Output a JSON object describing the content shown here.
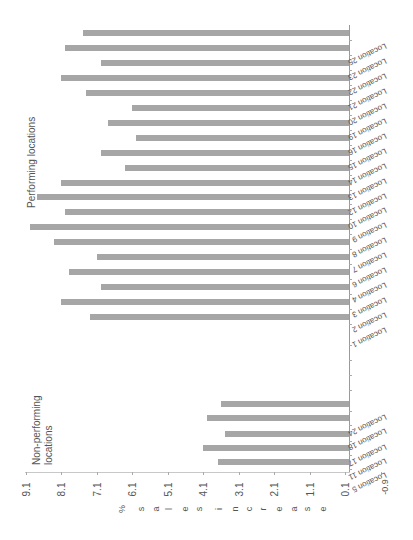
{
  "chart_data": {
    "type": "bar",
    "orientation": "rotated-90 (bars extend right-to-left; value axis along bottom)",
    "title": "",
    "ylabel": "% sales increase",
    "xlabel": "",
    "ylim": [
      -0.9,
      9.1
    ],
    "value_ticks": [
      "9.1",
      "8.1",
      "7.1",
      "6.1",
      "5.1",
      "4.1",
      "3.1",
      "2.1",
      "1.1",
      "0.1",
      "-0.9"
    ],
    "annotations": [
      "Performing locations",
      "Non-performing locations"
    ],
    "groups": [
      {
        "name": "Performing locations",
        "categories": [
          "Location 25",
          "Location 23",
          "Location 22",
          "Location 21",
          "Location 20",
          "Location 19",
          "Location 16",
          "Location 15",
          "Location 14",
          "Location 13",
          "Location 12",
          "Location 10",
          "Location 9",
          "Location 8",
          "Location 7",
          "Location 6",
          "Location 4",
          "Location 3",
          "Location 2",
          "Location 1"
        ],
        "values": [
          7.5,
          8.0,
          7.0,
          8.1,
          7.4,
          6.1,
          6.8,
          6.0,
          7.0,
          6.3,
          8.1,
          8.8,
          8.0,
          9.0,
          8.3,
          7.1,
          7.9,
          7.0,
          8.1,
          7.3
        ]
      },
      {
        "name": "Non-performing locations",
        "categories": [
          "Location 24",
          "Location 18",
          "Location 17",
          "Location 11",
          "Location 5"
        ],
        "values": [
          3.6,
          4.0,
          3.5,
          4.1,
          3.7
        ]
      }
    ]
  },
  "labels": {
    "performing": "Performing locations",
    "non_performing_1": "Non-performing",
    "non_performing_2": "locations",
    "ylabel": "% sales increase"
  }
}
